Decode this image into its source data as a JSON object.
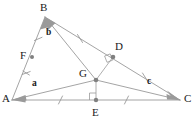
{
  "diagram": {
    "background_color": "#ffffff",
    "stroke_color": "#8c8c8c",
    "point_fill_color": "#808080",
    "label_color": "#1a1a1a",
    "width": 196,
    "height": 122,
    "vertices": [
      {
        "id": "A",
        "label": "A",
        "x": 12,
        "y": 100,
        "label_x": 2,
        "label_y": 95
      },
      {
        "id": "B",
        "label": "B",
        "x": 45,
        "y": 17,
        "label_x": 41,
        "label_y": 2
      },
      {
        "id": "C",
        "label": "C",
        "x": 180,
        "y": 100,
        "label_x": 184,
        "label_y": 95
      },
      {
        "id": "D",
        "label": "D",
        "x": 113,
        "y": 57,
        "label_x": 115,
        "label_y": 43
      },
      {
        "id": "E",
        "label": "E",
        "x": 96,
        "y": 100,
        "label_x": 92,
        "label_y": 108
      },
      {
        "id": "F",
        "label": "F",
        "x": 32,
        "y": 57,
        "label_x": 21,
        "label_y": 51
      },
      {
        "id": "G",
        "label": "G",
        "x": 96,
        "y": 80,
        "label_x": 80,
        "label_y": 70
      }
    ],
    "vector_labels": [
      {
        "id": "a",
        "label": "a",
        "x": 33,
        "y": 82
      },
      {
        "id": "b",
        "label": "b",
        "x": 47,
        "y": 31
      },
      {
        "id": "c",
        "label": "c",
        "x": 148,
        "y": 80
      }
    ],
    "segments": [
      {
        "id": "AB",
        "from": "A",
        "to": "B",
        "style": "solid"
      },
      {
        "id": "BC",
        "from": "B",
        "to": "C",
        "style": "solid"
      },
      {
        "id": "AC",
        "from": "A",
        "to": "C",
        "style": "solid"
      },
      {
        "id": "BG",
        "from": "B",
        "to": "G",
        "style": "solid"
      },
      {
        "id": "AG",
        "from": "A",
        "to": "G",
        "style": "solid"
      },
      {
        "id": "GC",
        "from": "G",
        "to": "C",
        "style": "solid"
      },
      {
        "id": "GD",
        "from": "G",
        "to": "D",
        "style": "solid"
      },
      {
        "id": "GE",
        "from": "G",
        "to": "E",
        "style": "solid"
      }
    ],
    "arrowheads": [
      {
        "id": "arrow-to-B",
        "on": "AB",
        "points_to": "B"
      },
      {
        "id": "arrow-to-B-from-G",
        "on": "BG",
        "points_to": "B"
      },
      {
        "id": "arrow-to-A-from-G",
        "on": "AG",
        "points_to": "A"
      },
      {
        "id": "arrow-to-A-from-C",
        "on": "AC",
        "points_to": "A"
      },
      {
        "id": "arrow-to-C-from-G",
        "on": "GC",
        "points_to": "C"
      },
      {
        "id": "arrow-to-C-from-D",
        "on": "BC",
        "points_to": "C"
      }
    ],
    "tick_marks": [
      {
        "id": "tick-AF-double",
        "segment": "AB",
        "position": "below-F",
        "count": 2,
        "note": "double tick between A and F"
      },
      {
        "id": "tick-FB-single",
        "segment": "AB",
        "position": "above-F",
        "count": 1,
        "note": "single tick between F and B"
      },
      {
        "id": "tick-BD",
        "segment": "BC",
        "position": "between-B-and-D",
        "count": 1
      },
      {
        "id": "tick-DC",
        "segment": "BC",
        "position": "between-D-and-C",
        "count": 1
      },
      {
        "id": "tick-AE",
        "segment": "AC",
        "position": "between-A-and-E",
        "count": 1
      },
      {
        "id": "tick-EC",
        "segment": "AC",
        "position": "between-E-and-C",
        "count": 1
      }
    ],
    "right_angles": [
      {
        "id": "right-angle-at-E",
        "vertex": "E",
        "between": [
          "G",
          "C"
        ],
        "size": 7
      },
      {
        "id": "right-angle-at-D",
        "vertex": "D",
        "between": [
          "G",
          "B"
        ],
        "size": 7
      }
    ]
  }
}
